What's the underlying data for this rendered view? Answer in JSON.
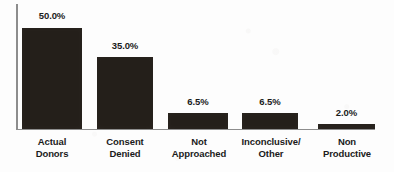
{
  "chart_data": {
    "type": "bar",
    "title": "",
    "subtitle": "",
    "xlabel": "",
    "ylabel": "",
    "ylim": [
      0,
      50
    ],
    "grid": false,
    "legend": false,
    "value_suffix": "%",
    "categories": [
      "Actual Donors",
      "Consent Denied",
      "Not Approached",
      "Inconclusive/ Other",
      "Non Productive"
    ],
    "values": [
      50.0,
      35.0,
      6.5,
      6.5,
      2.0
    ],
    "value_labels": [
      "50.0%",
      "35.0%",
      "6.5%",
      "6.5%",
      "2.0%"
    ],
    "category_lines": [
      [
        "Actual",
        "Donors"
      ],
      [
        "Consent",
        "Denied"
      ],
      [
        "Not",
        "Approached"
      ],
      [
        "Inconclusive/",
        "Other"
      ],
      [
        "Non",
        "Productive"
      ]
    ],
    "bar_color": "#241f1a",
    "axis_color": "#8d8d8d",
    "text_color": "#1b1b1b",
    "background_color": "#fdfdfd"
  },
  "geometry": {
    "baseline_y": 129,
    "axis_left_x": 16,
    "axis_top_y": 4,
    "axis_right_x": 375,
    "bars": [
      {
        "left": 22,
        "width": 60,
        "top": 28,
        "height": 101,
        "label_top": 10,
        "label_left": 22,
        "label_width": 60
      },
      {
        "left": 97,
        "width": 56,
        "top": 57,
        "height": 72,
        "label_top": 40,
        "label_left": 97,
        "label_width": 56
      },
      {
        "left": 168,
        "width": 60,
        "top": 113,
        "height": 16,
        "label_top": 96,
        "label_left": 168,
        "label_width": 60
      },
      {
        "left": 242,
        "width": 56,
        "top": 113,
        "height": 16,
        "label_top": 96,
        "label_left": 242,
        "label_width": 56
      },
      {
        "left": 318,
        "width": 57,
        "top": 124,
        "height": 5,
        "label_top": 107,
        "label_left": 318,
        "label_width": 57
      }
    ],
    "category_positions": [
      {
        "left": 12,
        "width": 80
      },
      {
        "left": 85,
        "width": 80
      },
      {
        "left": 158,
        "width": 82
      },
      {
        "left": 228,
        "width": 86
      },
      {
        "left": 306,
        "width": 82
      }
    ]
  }
}
